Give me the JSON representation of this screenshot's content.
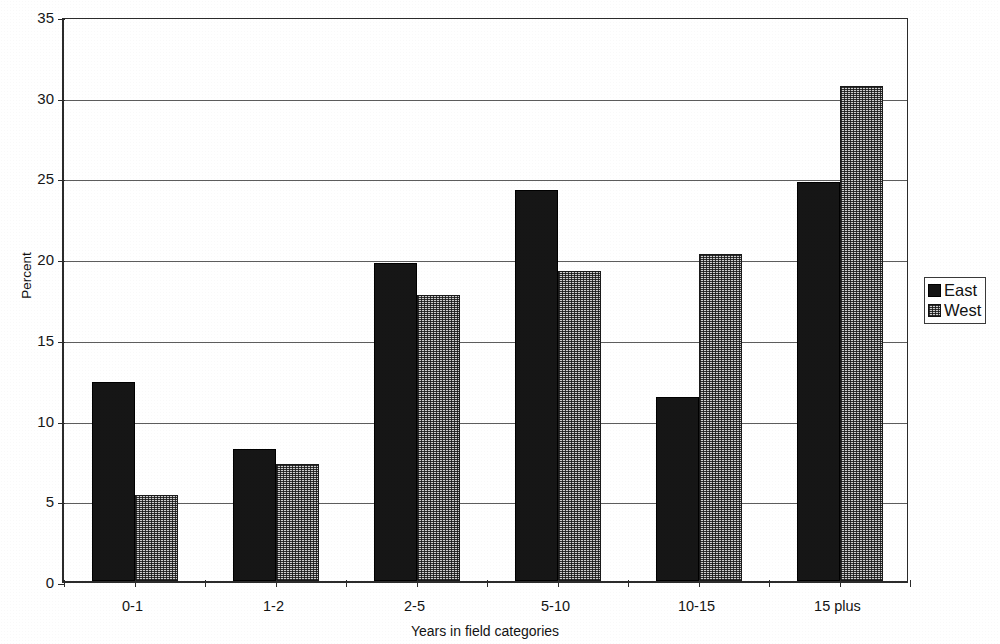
{
  "chart_data": {
    "type": "bar",
    "title": "",
    "subtitle": "",
    "xlabel": "Years in field categories",
    "ylabel": "Percent",
    "categories": [
      "0-1",
      "1-2",
      "2-5",
      "5-10",
      "10-15",
      "15 plus"
    ],
    "series": [
      {
        "name": "East",
        "values": [
          12.3,
          8.2,
          19.7,
          24.2,
          11.4,
          24.7
        ],
        "color": "#161616",
        "pattern": "solid-black"
      },
      {
        "name": "West",
        "values": [
          5.3,
          7.25,
          17.7,
          19.2,
          20.25,
          30.65
        ],
        "color": "#cfcfcf",
        "pattern": "fine-checker-dots"
      }
    ],
    "ylim": [
      0,
      35
    ],
    "ytick_values": [
      0,
      5,
      10,
      15,
      20,
      25,
      30,
      35
    ],
    "ytick_labels": [
      "0",
      "5",
      "10",
      "15",
      "20",
      "25",
      "30",
      "35"
    ],
    "grid": "horizontal-major",
    "legend_position": "right-outside",
    "legend_entries": [
      "East",
      "West"
    ],
    "bar_orientation": "vertical",
    "group_layout": "clustered"
  },
  "axes": {
    "y_title": "Percent",
    "x_title": "Years in field categories"
  },
  "legend": {
    "entries": [
      {
        "label": "East",
        "swatch": "legend-swatch-black"
      },
      {
        "label": "West",
        "swatch": "legend-swatch-dotted"
      }
    ]
  }
}
